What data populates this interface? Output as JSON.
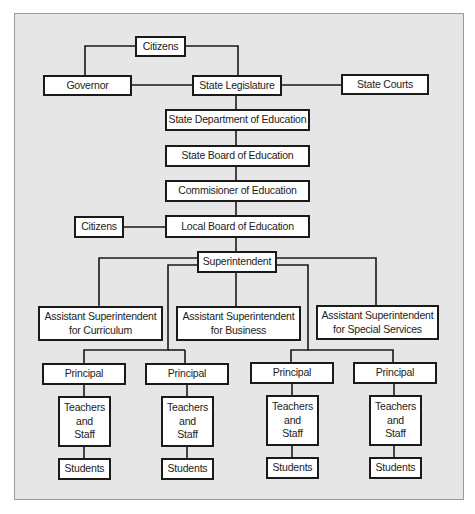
{
  "diagram": {
    "type": "organizational-chart",
    "nodes": {
      "citizens_top": "Citizens",
      "governor": "Governor",
      "state_legislature": "State Legislature",
      "state_courts": "State Courts",
      "state_dept_education": "State Department of Education",
      "state_board_education": "State Board of Education",
      "commissioner": "Commisioner of Education",
      "citizens_local": "Citizens",
      "local_board": "Local Board of Education",
      "superintendent": "Superintendent",
      "asst_curriculum_l1": "Assistant Superintendent",
      "asst_curriculum_l2": "for Curriculum",
      "asst_business_l1": "Assistant Superintendent",
      "asst_business_l2": "for Business",
      "asst_special_l1": "Assistant Superintendent",
      "asst_special_l2": "for Special Services",
      "principals": [
        "Principal",
        "Principal",
        "Principal",
        "Principal"
      ],
      "teachers": [
        [
          "Teachers",
          "and",
          "Staff"
        ],
        [
          "Teachers",
          "and",
          "Staff"
        ],
        [
          "Teachers",
          "and",
          "Staff"
        ],
        [
          "Teachers",
          "and",
          "Staff"
        ]
      ],
      "students": [
        "Students",
        "Students",
        "Students",
        "Students"
      ]
    },
    "edges": [
      [
        "Citizens",
        "Governor"
      ],
      [
        "Citizens",
        "State Legislature"
      ],
      [
        "Governor",
        "State Legislature"
      ],
      [
        "State Legislature",
        "State Courts"
      ],
      [
        "State Legislature",
        "State Department of Education"
      ],
      [
        "State Department of Education",
        "State Board of Education"
      ],
      [
        "State Board of Education",
        "Commisioner of Education"
      ],
      [
        "Commisioner of Education",
        "Local Board of Education"
      ],
      [
        "Citizens (local)",
        "Local Board of Education"
      ],
      [
        "Local Board of Education",
        "Superintendent"
      ],
      [
        "Superintendent",
        "Assistant Superintendent for Curriculum"
      ],
      [
        "Superintendent",
        "Assistant Superintendent for Business"
      ],
      [
        "Superintendent",
        "Assistant Superintendent for Special Services"
      ],
      [
        "Superintendent",
        "Principal 1"
      ],
      [
        "Superintendent",
        "Principal 2"
      ],
      [
        "Superintendent",
        "Principal 3"
      ],
      [
        "Superintendent",
        "Principal 4"
      ],
      [
        "Principal",
        "Teachers and Staff"
      ],
      [
        "Teachers and Staff",
        "Students"
      ]
    ]
  }
}
